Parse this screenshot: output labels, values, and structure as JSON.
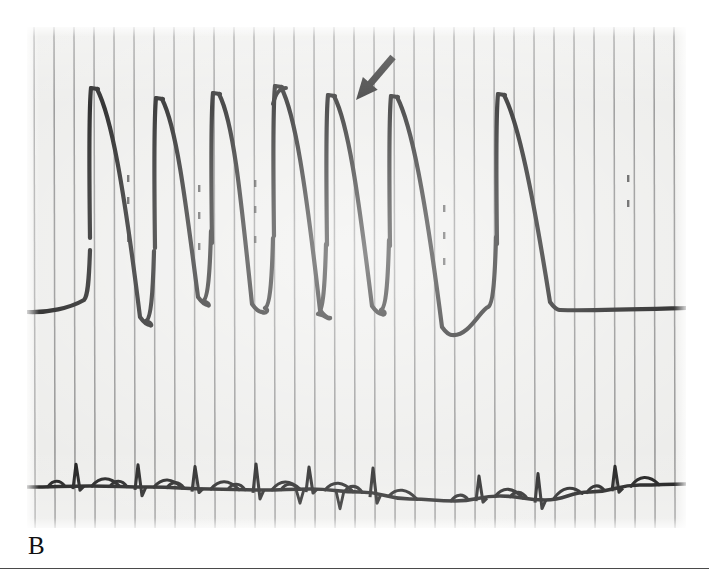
{
  "figure": {
    "panel_label": "B",
    "modality": "pressure-tracing",
    "arrow_annotation": "arrow marking anacrotic notch / spike-and-dome shoulder on the upstroke of beat 4"
  },
  "colors": {
    "paper": "#ececea",
    "gridline": "#7c7c7c",
    "trace_ink": "#0d0d0d",
    "panel_label": "#111111",
    "rule": "#4a4a4a",
    "page_background": "#ffffff"
  },
  "chart_data": {
    "type": "line",
    "title": "",
    "subtitle": "",
    "xlabel": "",
    "ylabel": "",
    "grid": "vertical-only",
    "legend": "none",
    "panel_px": {
      "x": 27,
      "y": 27,
      "width": 659,
      "height": 501
    },
    "gridlines": {
      "orientation": "vertical",
      "spacing_px": 20.0,
      "first_px": 7,
      "count": 34
    },
    "series": [
      {
        "name": "Left ventricular pressure",
        "kind": "pressure",
        "ink_width_px": 4.2,
        "baseline_y_px": 310,
        "peak_y_px": 88,
        "beats": [
          {
            "peak_x_px": 91,
            "peak_y_px": 88,
            "trough_x_px": 150,
            "trough_y_px": 325
          },
          {
            "peak_x_px": 156,
            "peak_y_px": 98,
            "trough_x_px": 208,
            "trough_y_px": 305
          },
          {
            "peak_x_px": 213,
            "peak_y_px": 93,
            "trough_x_px": 262,
            "trough_y_px": 312
          },
          {
            "peak_x_px": 275,
            "peak_y_px": 86,
            "trough_x_px": 330,
            "trough_y_px": 318
          },
          {
            "peak_x_px": 328,
            "peak_y_px": 95,
            "trough_x_px": 382,
            "trough_y_px": 314
          },
          {
            "peak_x_px": 391,
            "peak_y_px": 96,
            "trough_x_px": 452,
            "trough_y_px": 335
          },
          {
            "peak_x_px": 498,
            "peak_y_px": 94,
            "trough_x_px": 560,
            "trough_y_px": 310
          }
        ],
        "notes": "Slow upstroke with sharp apex, rapid decline; long compensatory pause after beat 6 with rising diastolic baseline"
      },
      {
        "name": "Surface ECG",
        "kind": "ecg",
        "ink_width_px": 3.6,
        "baseline_y_px": 487,
        "qrs_x_px": [
          78,
          140,
          197,
          258,
          311,
          375,
          481,
          540,
          617
        ],
        "notes": "P waves, narrow QRS complexes and T waves; baseline wander across the strip"
      }
    ],
    "annotations": [
      {
        "type": "arrow",
        "label": "",
        "tail_px": {
          "x": 393,
          "y": 57
        },
        "tip_px": {
          "x": 356,
          "y": 100
        },
        "direction": "down-left",
        "color": "#0d0d0d"
      }
    ]
  }
}
